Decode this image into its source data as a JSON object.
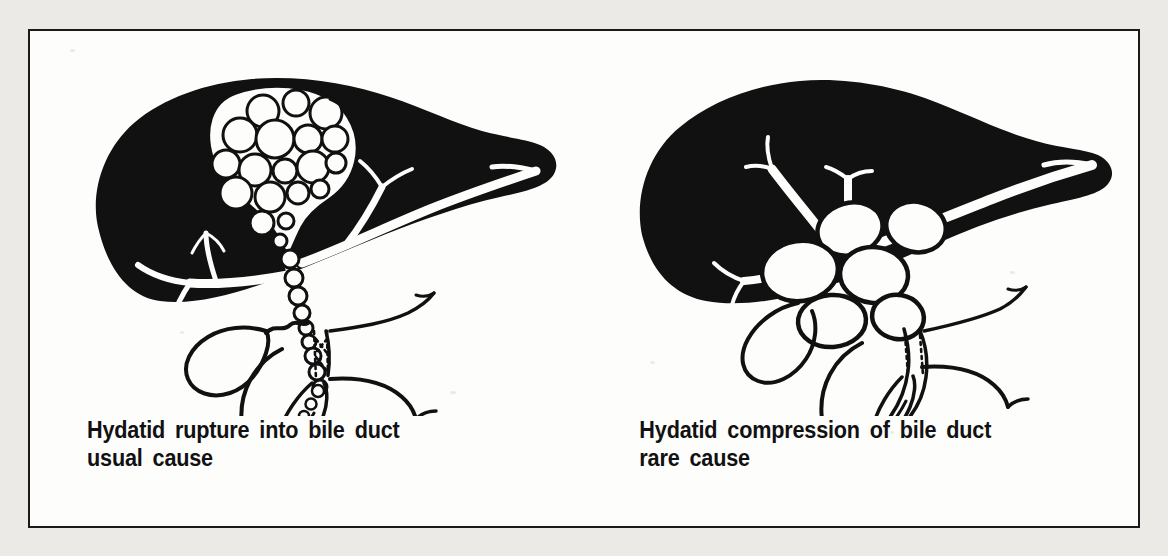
{
  "figure": {
    "kind": "medical-illustration",
    "border_color": "#1a1a1a",
    "page_background": "#eceae7",
    "panel_background": "#fdfdfc",
    "ink_color": "#111111",
    "panels": [
      {
        "id": "left",
        "caption_line1": "Hydatid rupture into bile duct",
        "caption_line2": "usual cause",
        "organs": {
          "liver": "liver-silhouette",
          "cyst": "hydatid-mother-cyst-with-daughter-cysts",
          "daughter_cyst_count": 19,
          "duct_cyst_chain_count": 9,
          "gallbladder": "gallbladder",
          "bile_duct": "common-bile-duct",
          "duodenum": "duodenum-c-loop",
          "pancreas_marker": "dotted-pancreas-segment",
          "ampulla": "ampulla-with-daughter-cysts"
        }
      },
      {
        "id": "right",
        "caption_line1": "Hydatid compression of bile duct",
        "caption_line2": "rare cause",
        "organs": {
          "liver": "liver-silhouette",
          "cyst": "hydatid-cyst-cluster",
          "cluster_cyst_count": 6,
          "gallbladder": "gallbladder",
          "bile_duct": "compressed-common-bile-duct",
          "duodenum": "duodenum-c-loop",
          "pancreas_marker": "dotted-pancreas-segment",
          "ampulla": "ampulla"
        }
      }
    ]
  }
}
